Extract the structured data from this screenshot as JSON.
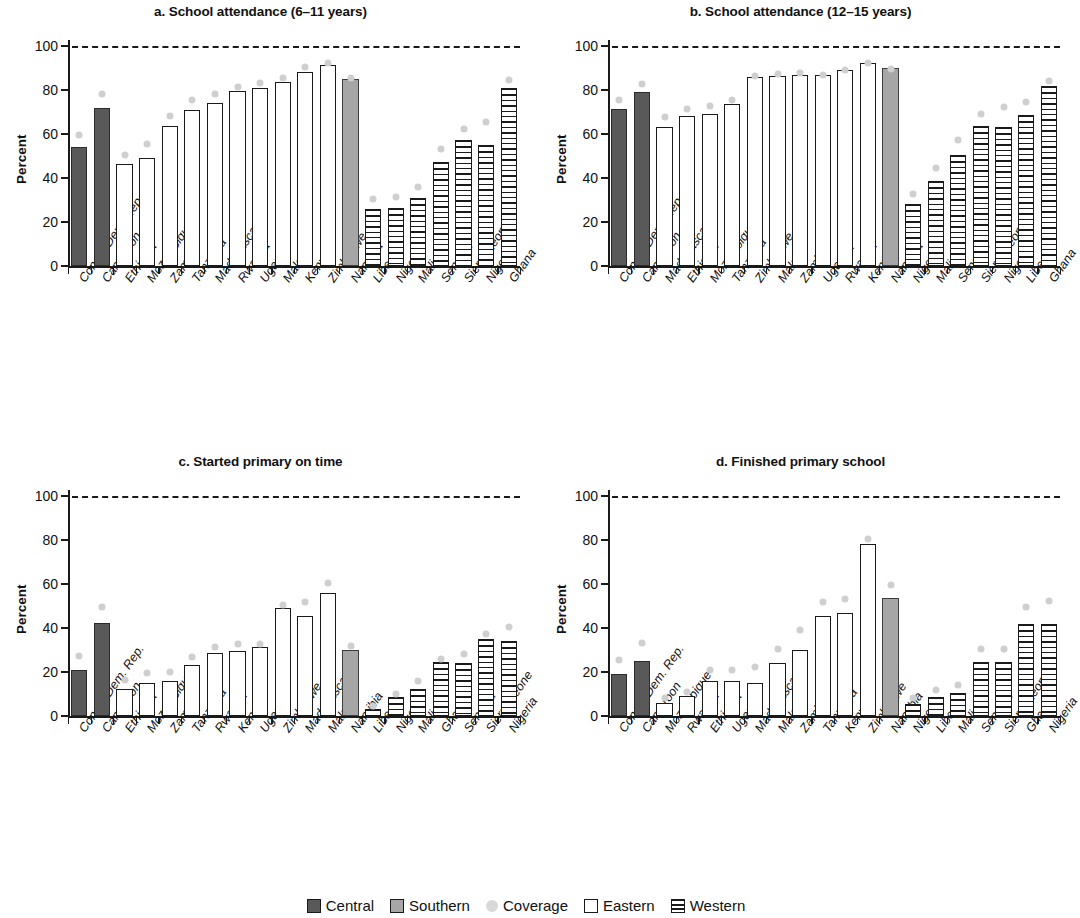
{
  "figure": {
    "ylabel": "Percent",
    "yticks": [
      "0",
      "20",
      "40",
      "60",
      "80",
      "100"
    ],
    "legend": [
      {
        "key": "central",
        "label": "Central"
      },
      {
        "key": "southern",
        "label": "Southern"
      },
      {
        "key": "coverage",
        "label": "Coverage"
      },
      {
        "key": "eastern",
        "label": "Eastern"
      },
      {
        "key": "western",
        "label": "Western"
      }
    ],
    "colors": {
      "central": "#595959",
      "southern": "#a6a6a6",
      "coverage": "#cfcfcf",
      "eastern": "#ffffff",
      "western": "#ffffff",
      "axis": "#1a1a1a"
    }
  },
  "chart_data": [
    {
      "panel": "a",
      "type": "bar",
      "title": "a. School attendance (6–11 years)",
      "xlabel": "",
      "ylabel": "Percent",
      "ylim": [
        0,
        100
      ],
      "yticks": [
        0,
        20,
        40,
        60,
        80,
        100
      ],
      "grid": false,
      "target_line": 100,
      "legend_position": "bottom",
      "categories": [
        "Congo, Dem. Rep.",
        "Cameroon",
        "Ethiopia",
        "Mozambique",
        "Zambia",
        "Tanzania",
        "Madagascar",
        "Rwanda",
        "Uganda",
        "Malawi",
        "Kenya",
        "Zimbabwe",
        "Namibia",
        "Liberia",
        "Niger",
        "Mali",
        "Senegal",
        "Sierra Leone",
        "Nigeria",
        "Ghana"
      ],
      "groups": [
        "central",
        "central",
        "eastern",
        "eastern",
        "eastern",
        "eastern",
        "eastern",
        "eastern",
        "eastern",
        "eastern",
        "eastern",
        "eastern",
        "southern",
        "western",
        "western",
        "western",
        "western",
        "western",
        "western",
        "western"
      ],
      "values": [
        54,
        72,
        46.5,
        49,
        63.5,
        71,
        74,
        79.5,
        81,
        83.5,
        88,
        91.5,
        85,
        26,
        26.5,
        31,
        47.5,
        57.5,
        55,
        81
      ],
      "series": [
        {
          "name": "Attendance",
          "values": [
            54,
            72,
            46.5,
            49,
            63.5,
            71,
            74,
            79.5,
            81,
            83.5,
            88,
            91.5,
            85,
            26,
            26.5,
            31,
            47.5,
            57.5,
            55,
            81
          ]
        },
        {
          "name": "Coverage",
          "values": [
            61,
            80,
            52,
            57,
            70,
            77,
            80,
            83,
            85,
            87,
            92,
            94,
            87,
            32,
            33,
            37.5,
            55,
            64,
            67,
            86
          ]
        }
      ]
    },
    {
      "panel": "b",
      "type": "bar",
      "title": "b. School attendance (12–15 years)",
      "xlabel": "",
      "ylabel": "Percent",
      "ylim": [
        0,
        100
      ],
      "yticks": [
        0,
        20,
        40,
        60,
        80,
        100
      ],
      "grid": false,
      "target_line": 100,
      "legend_position": "bottom",
      "categories": [
        "Congo, Dem. Rep.",
        "Cameroon",
        "Madagascar",
        "Ethiopia",
        "Mozambique",
        "Tanzania",
        "Zimbabwe",
        "Malawi",
        "Zambia",
        "Uganda",
        "Rwanda",
        "Kenya",
        "Namibia",
        "Niger",
        "Mali",
        "Senegal",
        "Sierra Leone",
        "Nigeria",
        "Liberia",
        "Ghana"
      ],
      "groups": [
        "central",
        "central",
        "eastern",
        "eastern",
        "eastern",
        "eastern",
        "eastern",
        "eastern",
        "eastern",
        "eastern",
        "eastern",
        "eastern",
        "southern",
        "western",
        "western",
        "western",
        "western",
        "western",
        "western",
        "western"
      ],
      "values": [
        71.5,
        79,
        63,
        68,
        69,
        73.5,
        86,
        86.5,
        87,
        87,
        89,
        92.5,
        90,
        28,
        38.5,
        50.5,
        63.5,
        63,
        68.5,
        82
      ],
      "series": [
        {
          "name": "Attendance",
          "values": [
            71.5,
            79,
            63,
            68,
            69,
            73.5,
            86,
            86.5,
            87,
            87,
            89,
            92.5,
            90,
            28,
            38.5,
            50.5,
            63.5,
            63,
            68.5,
            82
          ]
        },
        {
          "name": "Coverage",
          "values": [
            77,
            84.5,
            69.5,
            73,
            74.5,
            77,
            88,
            89,
            89.5,
            88.5,
            90.5,
            94,
            91,
            34.5,
            46,
            59,
            70.5,
            74,
            76,
            85.5
          ]
        }
      ]
    },
    {
      "panel": "c",
      "type": "bar",
      "title": "c. Started primary on time",
      "xlabel": "",
      "ylabel": "Percent",
      "ylim": [
        0,
        100
      ],
      "yticks": [
        0,
        20,
        40,
        60,
        80,
        100
      ],
      "grid": false,
      "target_line": 100,
      "legend_position": "bottom",
      "categories": [
        "Congo, Dem. Rep.",
        "Cameroon",
        "Ethiopia",
        "Mozambique",
        "Zambia",
        "Tanzania",
        "Rwanda",
        "Kenya",
        "Uganda",
        "Zimbabwe",
        "Madagascar",
        "Malawi",
        "Namibia",
        "Liberia",
        "Niger",
        "Mali",
        "Ghana",
        "Senegal",
        "Sierra Leone",
        "Nigeria"
      ],
      "groups": [
        "central",
        "central",
        "eastern",
        "eastern",
        "eastern",
        "eastern",
        "eastern",
        "eastern",
        "eastern",
        "eastern",
        "eastern",
        "eastern",
        "southern",
        "western",
        "western",
        "western",
        "western",
        "western",
        "western",
        "western"
      ],
      "values": [
        21,
        42.5,
        12.5,
        15,
        16,
        23,
        28.5,
        29.5,
        31.5,
        49,
        45.5,
        56,
        30,
        3,
        8.5,
        12.5,
        24.5,
        24,
        35,
        34
      ],
      "series": [
        {
          "name": "Started on time",
          "values": [
            21,
            42.5,
            12.5,
            15,
            16,
            23,
            28.5,
            29.5,
            31.5,
            49,
            45.5,
            56,
            30,
            3,
            8.5,
            12.5,
            24.5,
            24,
            35,
            34
          ]
        },
        {
          "name": "Coverage",
          "values": [
            29,
            51,
            18,
            21,
            21.5,
            28.5,
            33,
            34.5,
            34.5,
            52,
            53.5,
            62,
            33.5,
            6,
            11.5,
            17.5,
            27.5,
            30,
            39,
            42
          ]
        }
      ]
    },
    {
      "panel": "d",
      "type": "bar",
      "title": "d. Finished primary school",
      "xlabel": "",
      "ylabel": "Percent",
      "ylim": [
        0,
        100
      ],
      "yticks": [
        0,
        20,
        40,
        60,
        80,
        100
      ],
      "grid": false,
      "target_line": 100,
      "legend_position": "bottom",
      "categories": [
        "Congo, Dem. Rep.",
        "Cameroon",
        "Mozambique",
        "Rwanda",
        "Ethiopia",
        "Uganda",
        "Madagascar",
        "Malawi",
        "Zambia",
        "Tanzania",
        "Kenya",
        "Zimbabwe",
        "Namibia",
        "Niger",
        "Liberia",
        "Mali",
        "Senegal",
        "Sierra Leone",
        "Ghana",
        "Nigeria"
      ],
      "groups": [
        "central",
        "central",
        "eastern",
        "eastern",
        "eastern",
        "eastern",
        "eastern",
        "eastern",
        "eastern",
        "eastern",
        "eastern",
        "eastern",
        "southern",
        "western",
        "western",
        "western",
        "western",
        "western",
        "western",
        "western"
      ],
      "values": [
        19,
        25,
        6,
        9,
        16,
        16,
        15,
        24,
        30,
        45.5,
        47,
        78,
        53.5,
        5.5,
        8.5,
        10.5,
        24.5,
        24.5,
        42,
        42
      ],
      "series": [
        {
          "name": "Finished primary",
          "values": [
            19,
            25,
            6,
            9,
            16,
            16,
            15,
            24,
            30,
            45.5,
            47,
            78,
            53.5,
            5.5,
            8.5,
            10.5,
            24.5,
            24.5,
            42,
            42
          ]
        },
        {
          "name": "Coverage",
          "values": [
            27,
            35,
            10,
            12.5,
            22.5,
            22.5,
            24,
            32,
            40.5,
            53.5,
            55,
            82,
            61,
            10,
            13.5,
            15.5,
            32,
            32,
            51,
            54
          ]
        }
      ]
    }
  ]
}
